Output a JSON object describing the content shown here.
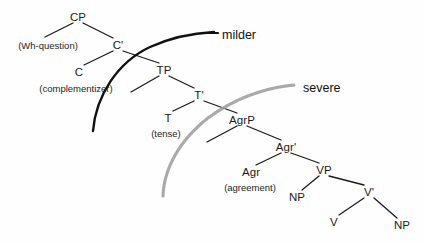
{
  "diagram": {
    "type": "syntax-tree",
    "title_visible": false,
    "background_color": "#fefefe",
    "branch_color": "#1b1b1b",
    "nodes": [
      {
        "id": "CP",
        "label": "CP",
        "x": 78,
        "y": 17
      },
      {
        "id": "Cbar",
        "label": "C'",
        "x": 118,
        "y": 45
      },
      {
        "id": "C",
        "label": "C",
        "x": 79,
        "y": 72
      },
      {
        "id": "TP",
        "label": "TP",
        "x": 164,
        "y": 70
      },
      {
        "id": "Tbar",
        "label": "T'",
        "x": 199,
        "y": 95
      },
      {
        "id": "T",
        "label": "T",
        "x": 168,
        "y": 118
      },
      {
        "id": "AgrP",
        "label": "AgrP",
        "x": 242,
        "y": 120
      },
      {
        "id": "Agrbar",
        "label": "Agr'",
        "x": 286,
        "y": 147
      },
      {
        "id": "Agr",
        "label": "Agr",
        "x": 251,
        "y": 172
      },
      {
        "id": "VP",
        "label": "VP",
        "x": 324,
        "y": 170
      },
      {
        "id": "NP1",
        "label": "NP",
        "x": 297,
        "y": 197
      },
      {
        "id": "Vbar",
        "label": "V'",
        "x": 369,
        "y": 192
      },
      {
        "id": "V",
        "label": "V",
        "x": 334,
        "y": 222
      },
      {
        "id": "NP2",
        "label": "NP",
        "x": 402,
        "y": 225
      }
    ],
    "glosses": [
      {
        "id": "wh",
        "label": "(Wh-question)",
        "x": 48,
        "y": 45
      },
      {
        "id": "complementizer",
        "label": "(complementizer)",
        "x": 76,
        "y": 88
      },
      {
        "id": "tense",
        "label": "(tense)",
        "x": 166,
        "y": 133
      },
      {
        "id": "agreement",
        "label": "(agreement)",
        "x": 250,
        "y": 187
      }
    ],
    "branches": [
      {
        "from": "CP",
        "to_x": 45,
        "to_y": 37,
        "note": "CP left branch (specifier)"
      },
      {
        "from": "CP",
        "to": "Cbar"
      },
      {
        "from": "Cbar",
        "to": "C"
      },
      {
        "from": "Cbar",
        "to": "TP"
      },
      {
        "from": "TP",
        "to_x": 131,
        "to_y": 92,
        "note": "TP left branch (specifier)"
      },
      {
        "from": "TP",
        "to": "Tbar"
      },
      {
        "from": "Tbar",
        "to": "T"
      },
      {
        "from": "Tbar",
        "to": "AgrP"
      },
      {
        "from": "AgrP",
        "to_x": 207,
        "to_y": 142,
        "note": "AgrP left branch (specifier)"
      },
      {
        "from": "AgrP",
        "to": "Agrbar"
      },
      {
        "from": "Agrbar",
        "to": "Agr"
      },
      {
        "from": "Agrbar",
        "to": "VP"
      },
      {
        "from": "VP",
        "to": "NP1"
      },
      {
        "from": "VP",
        "to": "Vbar"
      },
      {
        "from": "Vbar",
        "to": "V"
      },
      {
        "from": "Vbar",
        "to": "NP2"
      }
    ],
    "arcs": [
      {
        "id": "milder-arc",
        "label": "milder",
        "style": "solid-black",
        "color": "#111111",
        "label_x": 222,
        "label_y": 35,
        "path": "M 93 131 C 96 95, 118 62, 150 47 C 172 37, 196 33, 214 32"
      },
      {
        "id": "severe-arc",
        "label": "severe",
        "style": "dotted-gray",
        "color": "#9a9a9a",
        "label_x": 303,
        "label_y": 88,
        "path": "M 163 196 C 164 168, 180 140, 208 118 C 238 96, 270 87, 295 85"
      }
    ]
  }
}
